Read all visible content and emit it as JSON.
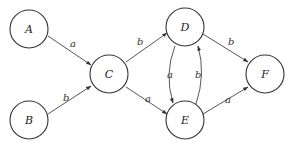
{
  "top_partial_text": "",
  "nodes": [
    {
      "id": "A",
      "label": "A",
      "cx": 29,
      "cy": 29
    },
    {
      "id": "B",
      "label": "B",
      "cx": 29,
      "cy": 120
    },
    {
      "id": "C",
      "label": "C",
      "cx": 109,
      "cy": 74
    },
    {
      "id": "D",
      "label": "D",
      "cx": 185,
      "cy": 27
    },
    {
      "id": "E",
      "label": "E",
      "cx": 185,
      "cy": 120
    },
    {
      "id": "F",
      "label": "F",
      "cx": 265,
      "cy": 74
    }
  ],
  "edges": [
    {
      "from": "A",
      "to": "C",
      "label": "a"
    },
    {
      "from": "B",
      "to": "C",
      "label": "b"
    },
    {
      "from": "C",
      "to": "D",
      "label": "b"
    },
    {
      "from": "C",
      "to": "E",
      "label": "a"
    },
    {
      "from": "D",
      "to": "E",
      "label": "a"
    },
    {
      "from": "E",
      "to": "D",
      "label": "b"
    },
    {
      "from": "D",
      "to": "F",
      "label": "b"
    },
    {
      "from": "E",
      "to": "F",
      "label": "a"
    }
  ]
}
